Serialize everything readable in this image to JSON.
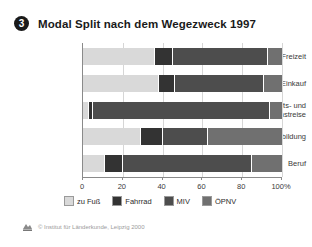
{
  "header": {
    "badge": "3",
    "title": "Modal Split nach dem Wegezweck 1997"
  },
  "footer": {
    "credit": "© Institut für Länderkunde, Leipzig 2000",
    "logo_icon": "institute-logo-icon"
  },
  "colors": {
    "zu_fuss": "#d9d9d9",
    "fahrrad": "#333333",
    "miv": "#4d4d4d",
    "oepnv": "#707070",
    "grid": "#d6d6d6",
    "axis": "#8a8a8a",
    "text": "#3a3a3a"
  },
  "chart_data": {
    "type": "bar",
    "orientation": "horizontal",
    "stacked": true,
    "normalized": true,
    "title": "Modal Split nach dem Wegezweck 1997",
    "xlabel": "",
    "ylabel": "",
    "xlim": [
      0,
      100
    ],
    "grid": true,
    "legend_position": "bottom",
    "xticks": [
      0,
      20,
      40,
      60,
      80,
      100
    ],
    "xticklabels": [
      "0",
      "20",
      "40",
      "60",
      "80",
      "100%"
    ],
    "categories": [
      "Freizeit",
      "Einkauf",
      "Geschäfts- und\nDienstreise",
      "Ausbildung",
      "Beruf"
    ],
    "series": [
      {
        "name": "zu Fuß",
        "color": "#d9d9d9",
        "values": [
          36,
          38,
          3,
          29,
          11
        ]
      },
      {
        "name": "Fahrrad",
        "color": "#333333",
        "values": [
          9,
          8,
          2,
          11,
          9
        ]
      },
      {
        "name": "MIV",
        "color": "#4d4d4d",
        "values": [
          48,
          45,
          89,
          23,
          65
        ]
      },
      {
        "name": "ÖPNV",
        "color": "#707070",
        "values": [
          7,
          9,
          6,
          37,
          15
        ]
      }
    ]
  }
}
